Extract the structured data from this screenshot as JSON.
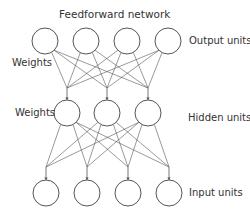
{
  "diagram": {
    "title": "Feedforward network",
    "labels": {
      "output_units": "Output units",
      "hidden_units": "Hidden units",
      "input_units": "Input units",
      "weights_top": "Weights",
      "weights_bottom": "Weights"
    },
    "layers": {
      "output": {
        "count": 4,
        "y": 41,
        "xs": [
          45,
          86,
          127,
          168
        ]
      },
      "hidden": {
        "count": 3,
        "y": 113,
        "xs": [
          67,
          107,
          148
        ]
      },
      "input": {
        "count": 4,
        "y": 193,
        "xs": [
          46,
          87,
          128,
          169
        ]
      }
    },
    "node_radius": 13,
    "colors": {
      "stroke": "#555555",
      "text": "#333333",
      "background": "#ffffff"
    }
  }
}
